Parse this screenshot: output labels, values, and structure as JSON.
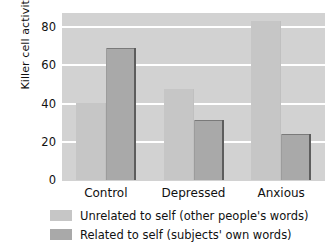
{
  "chart_data": {
    "type": "bar",
    "title": "",
    "subtitle": "",
    "xlabel": "",
    "ylabel": "Killer cell activity",
    "categories": [
      "Control",
      "Depressed",
      "Anxious"
    ],
    "yticks": [
      0,
      20,
      40,
      60,
      80
    ],
    "ytick_labels": [
      "0",
      "20",
      "40",
      "60",
      "80"
    ],
    "ylim": [
      0,
      88
    ],
    "grid": "horizontal-white",
    "legend_position": "below-axis-left",
    "series": [
      {
        "name": "Unrelated to self (other people's words)",
        "color": "#c6c6c6",
        "values": [
          41,
          48,
          84
        ]
      },
      {
        "name": "Related to self (subjects' own words)",
        "color": "#a9a9a9",
        "values": [
          69.5,
          32,
          24.5
        ]
      }
    ],
    "plot_background": "#d2d2d2",
    "gridline_color": "#ffffff",
    "page_background": "#ffffff"
  }
}
